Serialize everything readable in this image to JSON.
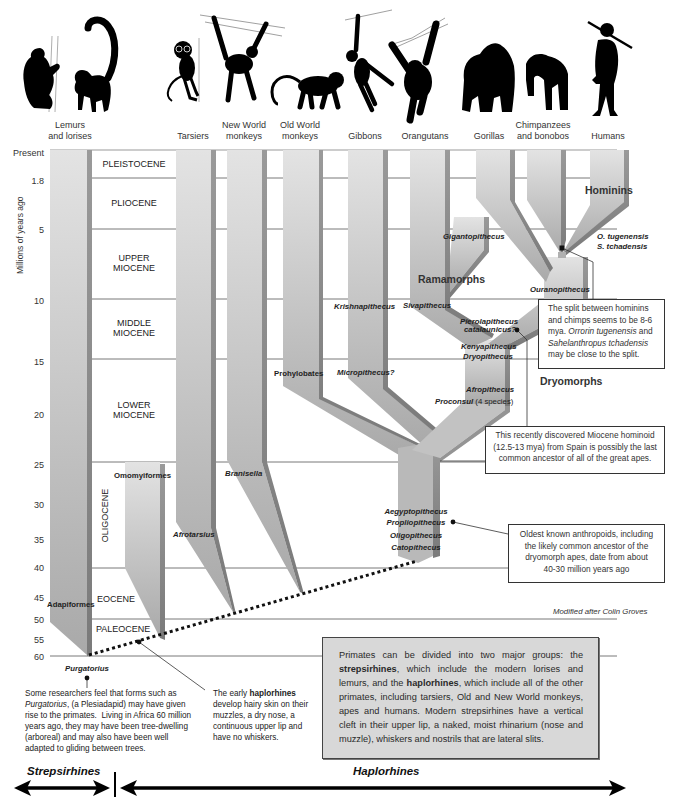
{
  "headers": [
    {
      "line1": "Lemurs",
      "line2": "and lorises"
    },
    {
      "line1": "",
      "line2": "Tarsiers"
    },
    {
      "line1": "New World",
      "line2": "monkeys"
    },
    {
      "line1": "Old World",
      "line2": "monkeys"
    },
    {
      "line1": "",
      "line2": "Gibbons"
    },
    {
      "line1": "",
      "line2": "Orangutans"
    },
    {
      "line1": "",
      "line2": "Gorillas"
    },
    {
      "line1": "Chimpanzees",
      "line2": "and bonobos"
    },
    {
      "line1": "",
      "line2": "Humans"
    }
  ],
  "y_axis": {
    "title": "Millions of years ago",
    "ticks": [
      "Present",
      "1.8",
      "5",
      "10",
      "15",
      "20",
      "25",
      "30",
      "35",
      "40",
      "45",
      "50",
      "55",
      "60"
    ]
  },
  "epochs": {
    "pleistocene": "PLEISTOCENE",
    "pliocene": "PLIOCENE",
    "upper_miocene": [
      "UPPER",
      "MIOCENE"
    ],
    "middle_miocene": [
      "MIDDLE",
      "MIOCENE"
    ],
    "lower_miocene": [
      "LOWER",
      "MIOCENE"
    ],
    "oligocene": "OLIGOCENE",
    "eocene": "EOCENE",
    "paleocene": "PALEOCENE"
  },
  "taxa": {
    "adapiformes": "Adapiformes",
    "omomyiformes": "Omomyiformes",
    "afrotarsius": "Afrotarsius",
    "branisella": "Branisella",
    "prohylobates": "Prohylobates",
    "krishnapithecus": "Krishnapithecus",
    "sivapithecus": "Sivapithecus",
    "micropithecus": "Micropithecus?",
    "gigantopithecus": "Gigantopithecus",
    "ouranopithecus": "Ouranopithecus",
    "o_tugenensis": "O. tugenensis",
    "s_tchadensis": "S. tchadensis",
    "pierolapithecus": "Pierolapithecus",
    "catalaunicus": "catalaunicus?",
    "kenyapithecus": "Kenyapithecus",
    "dryopithecus": "Dryopithecus",
    "afropithecus": "Afropithecus",
    "proconsul": "Proconsul",
    "proconsul_note": " (4 species)",
    "aegyptopithecus": "Aegyptopithecus",
    "propliopithecus": "Propliopithecus",
    "oligopithecus": "Oligopithecus",
    "catopithecus": "Catopithecus",
    "purgatorius": "Purgatorius"
  },
  "groups": {
    "ramamorphs": "Ramamorphs",
    "dryomorphs": "Dryomorphs",
    "hominins": "Hominins"
  },
  "callouts": {
    "hominin_split": {
      "lines": [
        [
          "The split between hominins"
        ],
        [
          "and chimps seems to be 8-6"
        ],
        [
          "mya. ",
          "Orrorin tugenensis",
          " and"
        ],
        [
          "Sahelanthropus tchadensis"
        ],
        [
          "may be close to the split."
        ]
      ]
    },
    "miocene_hominoid": {
      "lines": [
        "This recently discovered Miocene hominoid",
        "(12.5-13 mya) from Spain is possibly the last",
        "common ancestor of all of the great apes."
      ]
    },
    "oldest_anthropoids": {
      "lines": [
        "Oldest known anthropoids, including",
        "the likely common ancestor of the",
        "dryomorph apes, date from about",
        "40-30 million years ago"
      ]
    }
  },
  "credit": "Modified after Colin Groves",
  "notes": {
    "purgatorius": {
      "lines": [
        [
          "Some researchers feel that forms such as"
        ],
        [
          "Purgatorius",
          ", (a Plesiadapid) may have given"
        ],
        [
          "rise to the primates.  Living in Africa 60 million"
        ],
        [
          "years ago, they may have been tree-dwelling"
        ],
        [
          "(arboreal) and may also have been well"
        ],
        [
          "adapted to gliding between trees."
        ]
      ]
    },
    "haplorhines": {
      "lines": [
        [
          "The early ",
          "haplorhines"
        ],
        [
          "develop hairy skin on their"
        ],
        [
          "muzzles, a dry nose, a"
        ],
        [
          "continuous upper lip and"
        ],
        [
          "have no whiskers."
        ]
      ]
    }
  },
  "summary": {
    "lines": [
      [
        "Primates can be divided into two major groups: the"
      ],
      [
        "strepsirhines",
        ", which include the modern lorises and"
      ],
      [
        "lemurs, and the ",
        "haplorhines",
        ", which include all of the other"
      ],
      [
        "primates, including tarsiers, Old and New World monkeys,"
      ],
      [
        "apes and humans. Modern strepsirhines have a vertical"
      ],
      [
        "cleft in their upper lip, a naked, moist rhinarium (nose and"
      ],
      [
        "muzzle), whiskers and nostrils that are lateral slits."
      ]
    ]
  },
  "bottom": {
    "strepsirhines": "Strepsirhines",
    "haplorhines": "Haplorhines"
  },
  "colors": {
    "branch_light": "#d6d6d6",
    "branch_dark": "#8c8c8c",
    "summary_bg": "#d8d8d8"
  }
}
